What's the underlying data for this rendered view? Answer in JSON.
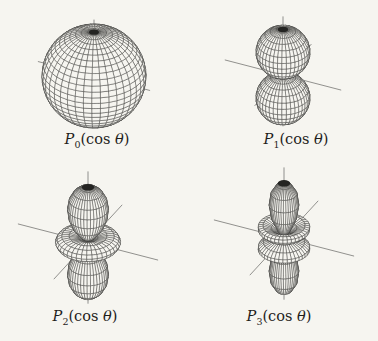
{
  "figure": {
    "background_color": "#f6f5f0",
    "line_color": "#3c3c3a",
    "pole_cap_color": "#242422",
    "label_color": "#1f1e1c",
    "view": {
      "azimuth_deg": 26,
      "elevation_deg": 32
    },
    "grid": {
      "parallels": 26,
      "meridians": 38
    },
    "axes": {
      "xy_length": 1.2,
      "z_length_top": 1.28,
      "z_length_bottom": 1.12
    },
    "plots": [
      {
        "id": "p0",
        "degree": 0,
        "shape": "sphere",
        "center": {
          "x": 94,
          "y": 76
        },
        "scale": 52,
        "label": {
          "base": "P",
          "sub": "0",
          "pre": "(cos ",
          "theta": "θ",
          "post": ")"
        }
      },
      {
        "id": "p1",
        "degree": 1,
        "shape": "two tangent lobes (dumbbell)",
        "center": {
          "x": 283,
          "y": 75
        },
        "scale": 54,
        "label": {
          "base": "P",
          "sub": "1",
          "pre": "(cos ",
          "theta": "θ",
          "post": ")"
        }
      },
      {
        "id": "p2",
        "degree": 2,
        "shape": "two polar lobes with equatorial ring",
        "center": {
          "x": 88,
          "y": 242
        },
        "scale": 65,
        "label": {
          "base": "P",
          "sub": "2",
          "pre": "(cos ",
          "theta": "θ",
          "post": ")"
        }
      },
      {
        "id": "p3",
        "degree": 3,
        "shape": "two polar lobes with two rings",
        "center": {
          "x": 284,
          "y": 238
        },
        "scale": 65,
        "label": {
          "base": "P",
          "sub": "3",
          "pre": "(cos ",
          "theta": "θ",
          "post": ")"
        }
      }
    ]
  }
}
